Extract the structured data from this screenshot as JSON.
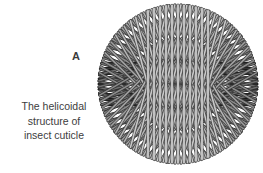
{
  "background": "#ffffff",
  "panel": {
    "label": "A"
  },
  "caption": {
    "text": "The helicoidal structure of insect cuticle",
    "lines": [
      "The helicoidal",
      "structure of",
      "insect cuticle"
    ],
    "color": "#3d3d3d"
  },
  "diagram": {
    "center": {
      "x": 178,
      "y": 84
    },
    "radius": 81,
    "rods_per_layer": 11,
    "rod_spacing": 5.9,
    "rod_outer_width": 3,
    "rod_inner_width": 1.6,
    "cap_inset": 2,
    "layers": [
      {
        "angle": 0,
        "fill": "#333333",
        "outline": "#111111",
        "count": 9,
        "spacing": 5.2
      },
      {
        "angle": 165,
        "fill": "#707070",
        "outline": "#2e2e2e"
      },
      {
        "angle": 15,
        "fill": "#707070",
        "outline": "#2e2e2e"
      },
      {
        "angle": 150,
        "fill": "#8c8c8c",
        "outline": "#363636"
      },
      {
        "angle": 30,
        "fill": "#8c8c8c",
        "outline": "#363636"
      },
      {
        "angle": 135,
        "fill": "#a0a0a0",
        "outline": "#3d3d3d"
      },
      {
        "angle": 45,
        "fill": "#a0a0a0",
        "outline": "#3d3d3d"
      },
      {
        "angle": 120,
        "fill": "#b4b4b4",
        "outline": "#454545"
      },
      {
        "angle": 60,
        "fill": "#b4b4b4",
        "outline": "#454545"
      },
      {
        "angle": 105,
        "fill": "#c8c8c8",
        "outline": "#4d4d4d"
      },
      {
        "angle": 75,
        "fill": "#c8c8c8",
        "outline": "#4d4d4d"
      },
      {
        "angle": 90,
        "fill": "#dedede",
        "outline": "#555555",
        "count": 11,
        "spacing": 6
      }
    ]
  }
}
